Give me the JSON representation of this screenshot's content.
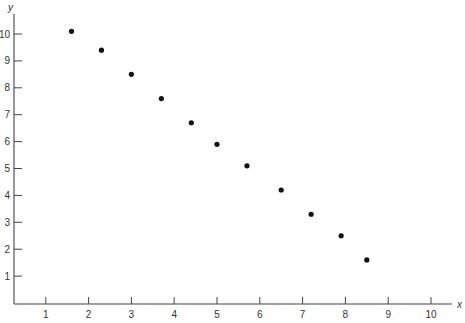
{
  "chart_data": {
    "type": "scatter",
    "title": "",
    "xlabel": "x",
    "ylabel": "y",
    "xlim": [
      0,
      10.7
    ],
    "ylim": [
      0,
      10.5
    ],
    "grid": false,
    "legend": null,
    "x_ticks": [
      1,
      2,
      3,
      4,
      5,
      6,
      7,
      8,
      9,
      10
    ],
    "y_ticks": [
      1,
      2,
      3,
      4,
      5,
      6,
      7,
      8,
      9,
      10
    ],
    "series": [
      {
        "name": "data",
        "marker": "filled-circle",
        "color": "#111111",
        "x": [
          1.6,
          2.3,
          3.0,
          3.7,
          4.4,
          5.0,
          5.7,
          6.5,
          7.2,
          7.9,
          8.5
        ],
        "y": [
          10.1,
          9.4,
          8.5,
          7.6,
          6.7,
          5.9,
          5.1,
          4.2,
          3.3,
          2.5,
          1.6
        ]
      }
    ]
  },
  "layout": {
    "origin_px": [
      3,
      303
    ],
    "x_px_per_unit": 42.8,
    "y_px_per_unit": 26.9,
    "axis_x_start": 14,
    "axis_x_end": 452,
    "axis_y_top": 14,
    "point_radius": 2.6
  }
}
